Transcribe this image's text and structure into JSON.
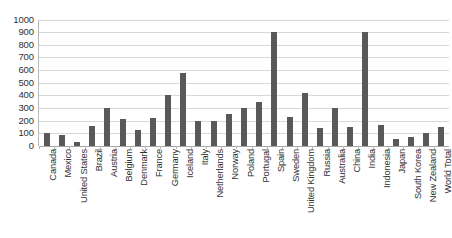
{
  "chart_data": {
    "type": "bar",
    "title": "",
    "xlabel": "",
    "ylabel": "",
    "ylim": [
      0,
      1000
    ],
    "ytick_step": 100,
    "grid": true,
    "legend": false,
    "bar_color": "#595959",
    "gridline_color": "#d9d9d9",
    "axis_color": "#a6a6a6",
    "ytick_labels": [
      "1000",
      "900",
      "800",
      "700",
      "600",
      "500",
      "400",
      "300",
      "200",
      "100",
      "0"
    ],
    "categories": [
      "Canada",
      "Mexico",
      "United States",
      "Brazil",
      "Austria",
      "Belgium",
      "Denmark",
      "France",
      "Germany",
      "Iceland",
      "Italy",
      "Netherlands",
      "Norway",
      "Poland",
      "Portugal",
      "Spain",
      "Sweden",
      "United Kingdom",
      "Russia",
      "Australia",
      "China",
      "India",
      "Indonesia",
      "Japan",
      "South Korea",
      "New Zealand",
      "World Total"
    ],
    "values": [
      100,
      90,
      35,
      160,
      300,
      210,
      130,
      220,
      400,
      580,
      200,
      200,
      255,
      300,
      350,
      900,
      230,
      420,
      140,
      300,
      150,
      900,
      170,
      55,
      75,
      105,
      150
    ]
  }
}
